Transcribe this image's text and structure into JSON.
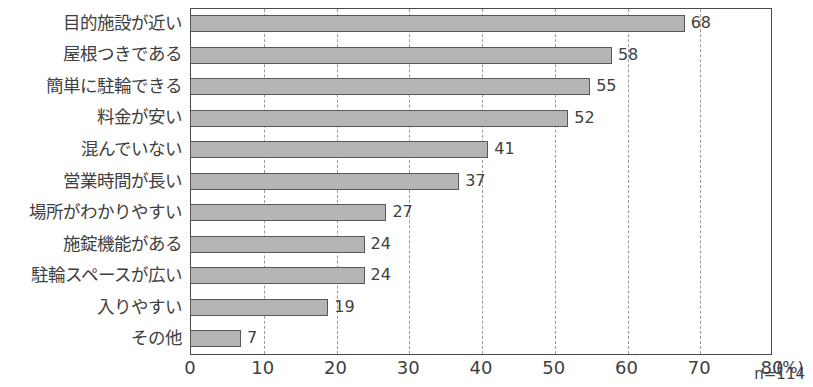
{
  "chart_data": {
    "type": "bar",
    "orientation": "horizontal",
    "title": "",
    "xlabel": "(%)",
    "ylabel": "",
    "xlim": [
      0,
      80
    ],
    "xticks": [
      0,
      10,
      20,
      30,
      40,
      50,
      60,
      70,
      80
    ],
    "grid": "vertical-dashed",
    "legend": "none",
    "annotation": "n=114",
    "unit_label": "(%)",
    "categories": [
      "目的施設が近い",
      "屋根つきである",
      "簡単に駐輪できる",
      "料金が安い",
      "混んでいない",
      "営業時間が長い",
      "場所がわかりやすい",
      "施錠機能がある",
      "駐輪スペースが広い",
      "入りやすい",
      "その他"
    ],
    "values": [
      68,
      58,
      55,
      52,
      41,
      37,
      27,
      24,
      24,
      19,
      7
    ],
    "value_labels": [
      "68",
      "58",
      "55",
      "52",
      "41",
      "37",
      "27",
      "24",
      "24",
      "19",
      "7"
    ],
    "colors": {
      "bar_fill": "#b5b5b5",
      "bar_border": "#585858",
      "axis": "#4a4a4a",
      "grid": "#9a9a9a",
      "text": "#404040",
      "background": "#ffffff"
    }
  }
}
